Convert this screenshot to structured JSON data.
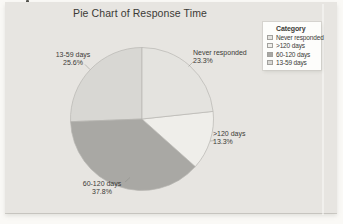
{
  "chart_data": {
    "type": "pie",
    "title": "Pie Chart of Response Time",
    "legend_title": "Category",
    "legend_position": "top-right",
    "direction": "clockwise",
    "start_angle_deg": 0,
    "slices": [
      {
        "label": "Never responded",
        "value": 23.3,
        "pct_label": "23.3%",
        "color": "#e4e3df"
      },
      {
        "label": ">120 days",
        "value": 13.3,
        "pct_label": "13.3%",
        "color": "#efeeea"
      },
      {
        "label": "60-120 days",
        "value": 37.8,
        "pct_label": "37.8%",
        "color": "#a9a8a4"
      },
      {
        "label": "13-59 days",
        "value": 25.6,
        "pct_label": "25.6%",
        "color": "#d8d7d3"
      }
    ]
  },
  "colors": {
    "page_background": "#faf9f6",
    "chart_background": "#e7e5e1",
    "legend_background": "#fdfdfb",
    "slice_border": "#b7b6b2",
    "text": "#3b3a36"
  }
}
